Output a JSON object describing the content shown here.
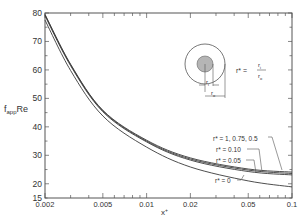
{
  "chart_data": {
    "type": "line",
    "title": "",
    "xlabel": "x+",
    "ylabel": "f_app Re",
    "xscale": "log",
    "xlim": [
      0.002,
      0.1
    ],
    "ylim": [
      15,
      80
    ],
    "grid": false,
    "x_ticks": [
      0.002,
      0.005,
      0.01,
      0.02,
      0.05,
      0.1
    ],
    "x_tick_labels": [
      "0.002",
      "0.005",
      "0.01",
      "0.02",
      "0.05",
      "0.1"
    ],
    "y_ticks": [
      15,
      20,
      30,
      40,
      50,
      60,
      70,
      80
    ],
    "y_tick_labels": [
      "15",
      "20",
      "30",
      "40",
      "50",
      "60",
      "70",
      "80"
    ],
    "x": [
      0.002,
      0.003,
      0.005,
      0.01,
      0.02,
      0.05,
      0.1
    ],
    "series": [
      {
        "name": "r* = 1, 0.75, 0.5",
        "values": [
          79.5,
          62.0,
          45.8,
          35.3,
          29.1,
          25.2,
          24.1
        ]
      },
      {
        "name": "r* = 0.10",
        "values": [
          79.3,
          61.8,
          45.6,
          35.0,
          28.7,
          24.8,
          23.6
        ]
      },
      {
        "name": "r* = 0.05",
        "values": [
          79.0,
          61.5,
          45.3,
          34.7,
          28.3,
          24.3,
          23.1
        ]
      },
      {
        "name": "r* = 0",
        "values": [
          77.5,
          59.8,
          43.8,
          32.9,
          25.9,
          21.0,
          18.9
        ]
      }
    ],
    "annotations": [
      {
        "text": "r* = 1, 0.75, 0.5",
        "points_to_x": 0.085
      },
      {
        "text": "r* = 0.10",
        "points_to_x": 0.06
      },
      {
        "text": "r* = 0.05",
        "points_to_x": 0.055
      },
      {
        "text": "r* = 0",
        "points_to_x": 0.03
      }
    ],
    "inset": {
      "description": "Concentric annulus cross-section: inner shaded core radius r_i, outer radius r_o",
      "formula": "r* = r_i / r_o",
      "labels": [
        "r_i",
        "r_o"
      ]
    }
  },
  "labels": {
    "ylabel_main": "f",
    "ylabel_sub": "app",
    "ylabel_tail": "Re",
    "xlabel": "x",
    "xlabel_sup": "+",
    "formula_lhs": "r* =",
    "formula_num": "r",
    "formula_num_sub": "i",
    "formula_den": "r",
    "formula_den_sub": "o",
    "ri": "r",
    "ri_sub": "i",
    "ro": "r",
    "ro_sub": "o",
    "ann_top": "r* = 1, 0.75, 0.5",
    "ann_010": "r* = 0.10",
    "ann_005": "r* = 0.05",
    "ann_0": "r* = 0"
  },
  "colors": {
    "line": "#3a3a3a",
    "axis": "#555555",
    "inner_core": "#b5b5b5"
  }
}
